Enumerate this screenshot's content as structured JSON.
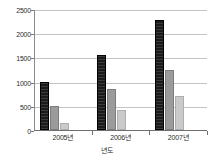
{
  "chart_data": {
    "type": "bar",
    "title": "",
    "xlabel": "년도",
    "ylabel": "",
    "categories": [
      "2005년",
      "2006년",
      "2007년"
    ],
    "series": [
      {
        "name": "series-1",
        "color": "#1b1b1b",
        "values": [
          1000,
          1550,
          2280
        ]
      },
      {
        "name": "series-2",
        "color": "#9b9b9b",
        "values": [
          500,
          850,
          1250
        ]
      },
      {
        "name": "series-3",
        "color": "#cacaca",
        "values": [
          150,
          420,
          700
        ]
      }
    ],
    "ylim": [
      0,
      2500
    ],
    "ytick_values": [
      0,
      500,
      1000,
      1500,
      2000,
      2500
    ],
    "ytick_labels": [
      "0",
      "500",
      "1000",
      "1500",
      "2000",
      "2500"
    ],
    "grid": true,
    "grid_axis": "y",
    "legend": false,
    "legend_position": "none",
    "background_color": "#ffffff",
    "axis_color": "#6f6f6f",
    "gridline_color": "#c4c4c4"
  }
}
